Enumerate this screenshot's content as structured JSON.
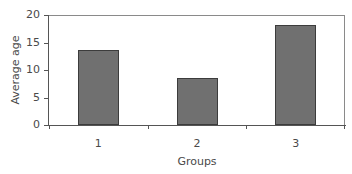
{
  "chart_data": {
    "type": "bar",
    "title": "",
    "xlabel": "Groups",
    "ylabel": "Average age",
    "categories": [
      "1",
      "2",
      "3"
    ],
    "values": [
      13.6,
      8.5,
      18.2
    ],
    "ylim": [
      0,
      20
    ],
    "yticks": [
      "0",
      "5",
      "10",
      "15",
      "20"
    ],
    "grid": false,
    "legend": null,
    "bar_color": "#707070",
    "bar_edge_color": "#3c3c3c"
  }
}
